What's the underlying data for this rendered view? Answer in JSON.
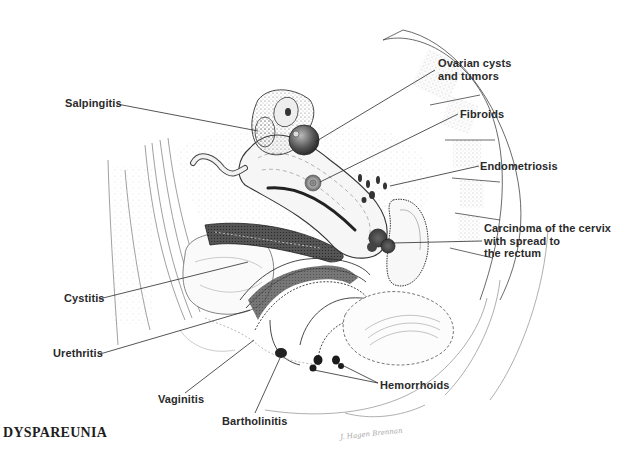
{
  "figure": {
    "title": "DYSPAREUNIA",
    "signature": "J. Hagen Brennan"
  },
  "labels": {
    "salpingitis": "Salpingitis",
    "ovarian_line1": "Ovarian cysts",
    "ovarian_line2": "and tumors",
    "fibroids": "Fibroids",
    "endometriosis": "Endometriosis",
    "carcinoma_line1": "Carcinoma of the cervix",
    "carcinoma_line2": "with spread to",
    "carcinoma_line3": "the rectum",
    "cystitis": "Cystitis",
    "urethritis": "Urethritis",
    "vaginitis": "Vaginitis",
    "bartholinitis": "Bartholinitis",
    "hemorrhoids": "Hemorrhoids"
  },
  "colors": {
    "ink": "#2a2a2a",
    "stipple": "#555555",
    "background": "#ffffff"
  }
}
